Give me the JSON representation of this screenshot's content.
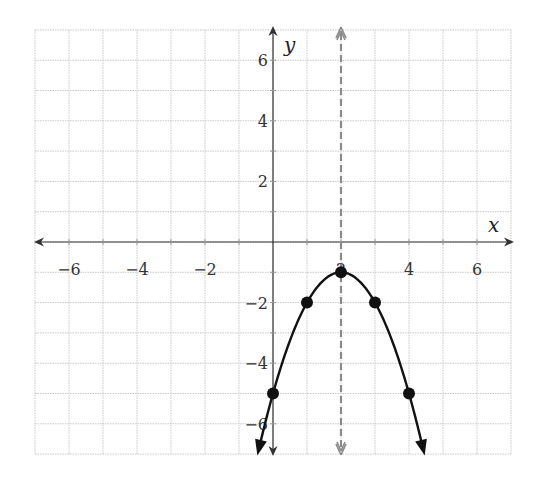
{
  "chart_data": {
    "type": "line",
    "title": "",
    "xlabel": "x",
    "ylabel": "y",
    "xlim": [
      -7,
      7
    ],
    "ylim": [
      -7,
      7
    ],
    "grid": true,
    "grid_step": 1,
    "x_ticks": [
      -6,
      -4,
      -2,
      2,
      4,
      6
    ],
    "y_ticks": [
      6,
      4,
      2,
      -2,
      -4,
      -6
    ],
    "x_tick_labels": [
      "−6",
      "−4",
      "−2",
      "2",
      "4",
      "6"
    ],
    "y_tick_labels": [
      "6",
      "4",
      "2",
      "−2",
      "−4",
      "−6"
    ],
    "series": [
      {
        "name": "parabola",
        "equation": "y = -(x - 2)^2 - 1",
        "color": "#111111",
        "points": [
          {
            "x": 0,
            "y": -5
          },
          {
            "x": 1,
            "y": -2
          },
          {
            "x": 2,
            "y": -1
          },
          {
            "x": 3,
            "y": -2
          },
          {
            "x": 4,
            "y": -5
          }
        ],
        "arrows_both_ends": true
      },
      {
        "name": "axis-of-symmetry",
        "equation": "x = 2",
        "style": "dashed",
        "color": "#888888",
        "arrows_both_ends": true
      }
    ],
    "vertex": {
      "x": 2,
      "y": -1
    }
  },
  "colors": {
    "grid": "#c8c8c8",
    "axis": "#333333",
    "curve": "#111111",
    "symmetry_line": "#8a8a8a"
  }
}
